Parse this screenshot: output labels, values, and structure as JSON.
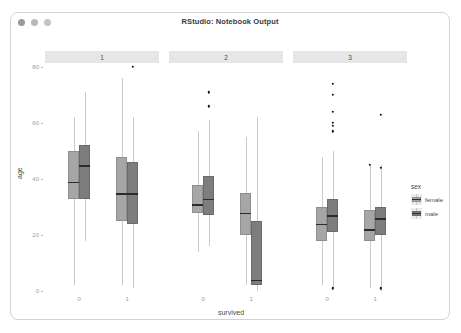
{
  "window": {
    "title": "RStudio: Notebook Output",
    "traffic_lights": [
      "close",
      "minimize",
      "zoom"
    ]
  },
  "chart_data": {
    "type": "boxplot",
    "title": "",
    "xlabel": "survived",
    "ylabel": "age",
    "ylim": [
      0,
      80
    ],
    "yticks": [
      0,
      20,
      40,
      60,
      80
    ],
    "facet_variable": "pclass",
    "facets": [
      "1",
      "2",
      "3"
    ],
    "x_categories": [
      "0",
      "1"
    ],
    "legend": {
      "title": "sex",
      "position": "right",
      "entries": [
        {
          "label": "female",
          "color": "#a6a6a6"
        },
        {
          "label": "male",
          "color": "#7d7d7d"
        }
      ]
    },
    "groups": [
      {
        "facet": "1",
        "survived": "0",
        "sex": "female",
        "min": 2,
        "q1": 33,
        "median": 39,
        "q3": 50,
        "max": 62,
        "outliers": []
      },
      {
        "facet": "1",
        "survived": "0",
        "sex": "male",
        "min": 18,
        "q1": 33,
        "median": 45,
        "q3": 52,
        "max": 71,
        "outliers": []
      },
      {
        "facet": "1",
        "survived": "1",
        "sex": "female",
        "min": 2,
        "q1": 25,
        "median": 35,
        "q3": 48,
        "max": 76,
        "outliers": []
      },
      {
        "facet": "1",
        "survived": "1",
        "sex": "male",
        "min": 1,
        "q1": 24,
        "median": 35,
        "q3": 46,
        "max": 62,
        "outliers": [
          80
        ]
      },
      {
        "facet": "2",
        "survived": "0",
        "sex": "female",
        "min": 14,
        "q1": 28,
        "median": 31,
        "q3": 38,
        "max": 57,
        "outliers": []
      },
      {
        "facet": "2",
        "survived": "0",
        "sex": "male",
        "min": 16,
        "q1": 27,
        "median": 33,
        "q3": 41,
        "max": 61,
        "outliers": [
          71,
          66
        ]
      },
      {
        "facet": "2",
        "survived": "1",
        "sex": "female",
        "min": 2,
        "q1": 20,
        "median": 28,
        "q3": 35,
        "max": 55,
        "outliers": []
      },
      {
        "facet": "2",
        "survived": "1",
        "sex": "male",
        "min": 0,
        "q1": 2,
        "median": 4,
        "q3": 25,
        "max": 62,
        "outliers": []
      },
      {
        "facet": "3",
        "survived": "0",
        "sex": "female",
        "min": 2,
        "q1": 18,
        "median": 24,
        "q3": 30,
        "max": 48,
        "outliers": []
      },
      {
        "facet": "3",
        "survived": "0",
        "sex": "male",
        "min": 1,
        "q1": 21,
        "median": 27,
        "q3": 33,
        "max": 50,
        "outliers": [
          74,
          70,
          64,
          60,
          59,
          57,
          1
        ]
      },
      {
        "facet": "3",
        "survived": "1",
        "sex": "female",
        "min": 1,
        "q1": 18,
        "median": 22,
        "q3": 29,
        "max": 45,
        "outliers": [
          45
        ]
      },
      {
        "facet": "3",
        "survived": "1",
        "sex": "male",
        "min": 0,
        "q1": 20,
        "median": 26,
        "q3": 30,
        "max": 45,
        "outliers": [
          63,
          44,
          1
        ]
      }
    ]
  }
}
